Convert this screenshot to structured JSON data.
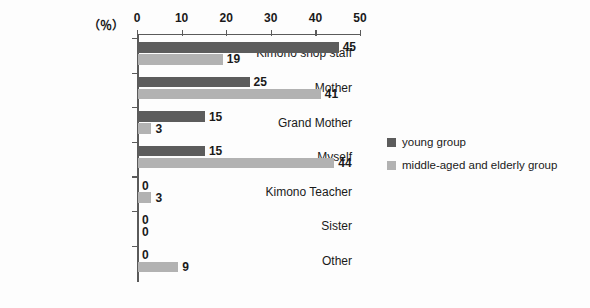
{
  "chart_data": {
    "type": "bar",
    "orientation": "horizontal",
    "title": "",
    "xlabel": "（％）",
    "ylabel": "",
    "xlim": [
      0,
      50
    ],
    "xticks": [
      0,
      10,
      20,
      30,
      40,
      50
    ],
    "grid": false,
    "legend_position": "right",
    "categories": [
      "Kimono shop staff",
      "Mother",
      "Grand Mother",
      "Myself",
      "Kimono Teacher",
      "Sister",
      "Other"
    ],
    "series": [
      {
        "name": "young group",
        "color": "#5c5c5c",
        "values": [
          45,
          25,
          15,
          15,
          0,
          0,
          0
        ]
      },
      {
        "name": "middle-aged and elderly group",
        "color": "#b2b2b2",
        "values": [
          19,
          41,
          3,
          44,
          3,
          0,
          9
        ]
      }
    ]
  },
  "axis": {
    "unit_label": "（％）",
    "tick_labels": [
      "0",
      "10",
      "20",
      "30",
      "40",
      "50"
    ]
  },
  "legend": {
    "items": [
      {
        "label": "young group",
        "color": "#5c5c5c"
      },
      {
        "label": "middle-aged and elderly group",
        "color": "#b2b2b2"
      }
    ]
  }
}
